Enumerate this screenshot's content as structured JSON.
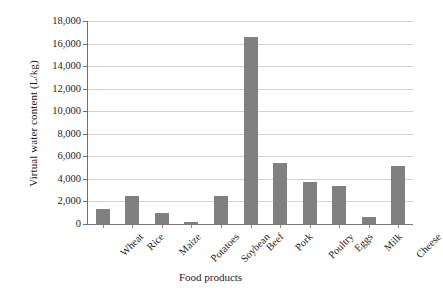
{
  "chart_data": {
    "type": "bar",
    "title": "",
    "xlabel": "Food products",
    "ylabel": "Virtual water content (L/kg)",
    "categories": [
      "Wheat",
      "Rice",
      "Maize",
      "Potatoes",
      "Soybean",
      "Beef",
      "Pork",
      "Poultry",
      "Eggs",
      "Milk",
      "Cheese"
    ],
    "values": [
      1350,
      2500,
      1000,
      160,
      2450,
      16600,
      5400,
      3700,
      3400,
      600,
      5150
    ],
    "series": [
      {
        "name": "Virtual water content",
        "values": [
          1350,
          2500,
          1000,
          160,
          2450,
          16600,
          5400,
          3700,
          3400,
          600,
          5150
        ]
      }
    ],
    "ylim": [
      0,
      18000
    ],
    "ytick_values": [
      0,
      2000,
      4000,
      6000,
      8000,
      10000,
      12000,
      14000,
      16000,
      18000
    ],
    "ytick_labels": [
      "0",
      "2,000",
      "4,000",
      "6,000",
      "8,000",
      "10,000",
      "12,000",
      "14,000",
      "16,000",
      "18,000"
    ],
    "grid": true,
    "grid_axis": "y",
    "legend": false,
    "legend_position": "none",
    "bar_color": "#808080",
    "grid_color": "#d2d2d2",
    "axis_color": "#6f6f6f",
    "background_color": "#ffffff",
    "xtick_label_rotation": -45
  }
}
